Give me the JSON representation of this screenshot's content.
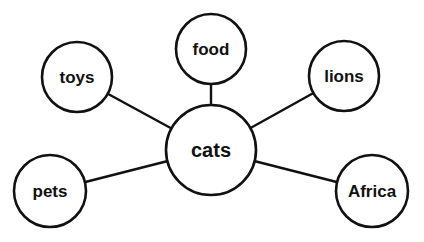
{
  "diagram": {
    "type": "mind-map",
    "center": {
      "id": "cats",
      "label": "cats"
    },
    "nodes": [
      {
        "id": "food",
        "label": "food"
      },
      {
        "id": "toys",
        "label": "toys"
      },
      {
        "id": "lions",
        "label": "lions"
      },
      {
        "id": "pets",
        "label": "pets"
      },
      {
        "id": "africa",
        "label": "Africa"
      }
    ],
    "edges": [
      {
        "from": "cats",
        "to": "food"
      },
      {
        "from": "cats",
        "to": "toys"
      },
      {
        "from": "cats",
        "to": "lions"
      },
      {
        "from": "cats",
        "to": "pets"
      },
      {
        "from": "cats",
        "to": "africa"
      }
    ],
    "colors": {
      "stroke": "#111111",
      "fill": "#ffffff",
      "text": "#111111"
    }
  }
}
